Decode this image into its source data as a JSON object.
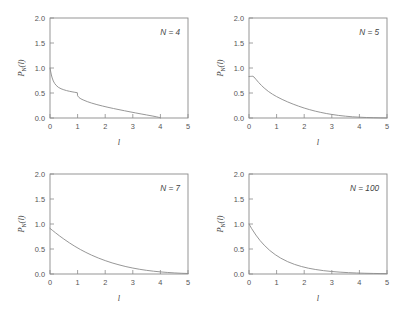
{
  "figure": {
    "background": "#ffffff",
    "curve_color": "#8b8b8b",
    "axis_color": "#8a8a8a",
    "panel_count": 4
  },
  "axes": {
    "xlabel": "l",
    "ylabel_main": "P",
    "ylabel_sub": "N",
    "ylabel_arg": "(l)",
    "xticks": [
      "0",
      "1",
      "2",
      "3",
      "4",
      "5"
    ],
    "yticks": [
      "0.0",
      "0.5",
      "1.0",
      "1.5",
      "2.0"
    ],
    "xlim": [
      0,
      5
    ],
    "ylim": [
      0,
      2
    ]
  },
  "panels": [
    {
      "id": "panel-n4",
      "annotation": "N = 4"
    },
    {
      "id": "panel-n5",
      "annotation": "N = 5"
    },
    {
      "id": "panel-n7",
      "annotation": "N = 7"
    },
    {
      "id": "panel-n100",
      "annotation": "N = 100"
    }
  ],
  "chart_data": {
    "type": "line",
    "title": "",
    "xlabel": "l",
    "ylabel": "P_N(l)",
    "xlim": [
      0,
      5
    ],
    "ylim": [
      0,
      2
    ],
    "xticks": [
      0,
      1,
      2,
      3,
      4,
      5
    ],
    "yticks": [
      0.0,
      0.5,
      1.0,
      1.5,
      2.0
    ],
    "grid": false,
    "legend": "none",
    "panel_layout": "2x2",
    "series": [
      {
        "name": "N = 4",
        "annotation": "N = 4",
        "panel": 0,
        "x": [
          0.0,
          0.02,
          0.05,
          0.08,
          0.12,
          0.17,
          0.22,
          0.3,
          0.4,
          0.5,
          0.6,
          0.7,
          0.8,
          0.9,
          0.99,
          1.0,
          1.05,
          1.12,
          1.2,
          1.35,
          1.5,
          1.7,
          1.9,
          2.1,
          2.3,
          2.5,
          2.7,
          2.9,
          3.1,
          3.3,
          3.5,
          3.7,
          3.85,
          3.94,
          3.98,
          4.0
        ],
        "y": [
          1.0,
          0.94,
          0.86,
          0.8,
          0.74,
          0.69,
          0.655,
          0.615,
          0.585,
          0.565,
          0.548,
          0.535,
          0.524,
          0.514,
          0.506,
          0.445,
          0.41,
          0.383,
          0.362,
          0.328,
          0.3,
          0.268,
          0.24,
          0.214,
          0.19,
          0.167,
          0.145,
          0.123,
          0.102,
          0.081,
          0.061,
          0.041,
          0.025,
          0.013,
          0.006,
          0.0
        ]
      },
      {
        "name": "N = 5",
        "annotation": "N = 5",
        "panel": 1,
        "x": [
          0.0,
          0.05,
          0.1,
          0.14,
          0.18,
          0.25,
          0.35,
          0.45,
          0.55,
          0.7,
          0.85,
          1.0,
          1.2,
          1.4,
          1.6,
          1.8,
          2.0,
          2.2,
          2.4,
          2.6,
          2.8,
          3.0,
          3.25,
          3.5,
          3.75,
          4.0,
          4.25,
          4.5,
          4.75,
          5.0
        ],
        "y": [
          0.83,
          0.832,
          0.834,
          0.835,
          0.82,
          0.775,
          0.71,
          0.652,
          0.6,
          0.532,
          0.476,
          0.428,
          0.372,
          0.322,
          0.277,
          0.236,
          0.199,
          0.166,
          0.137,
          0.112,
          0.09,
          0.071,
          0.051,
          0.036,
          0.024,
          0.016,
          0.01,
          0.006,
          0.003,
          0.001
        ]
      },
      {
        "name": "N = 7",
        "annotation": "N = 7",
        "panel": 2,
        "x": [
          0.0,
          0.1,
          0.2,
          0.35,
          0.5,
          0.7,
          0.9,
          1.1,
          1.3,
          1.5,
          1.75,
          2.0,
          2.25,
          2.5,
          2.75,
          3.0,
          3.25,
          3.5,
          3.75,
          4.0,
          4.25,
          4.5,
          4.75,
          5.0
        ],
        "y": [
          0.912,
          0.868,
          0.824,
          0.76,
          0.7,
          0.624,
          0.554,
          0.49,
          0.432,
          0.379,
          0.32,
          0.268,
          0.222,
          0.183,
          0.148,
          0.119,
          0.094,
          0.073,
          0.056,
          0.042,
          0.031,
          0.022,
          0.015,
          0.01
        ]
      },
      {
        "name": "N = 100",
        "annotation": "N = 100",
        "panel": 3,
        "x": [
          0.0,
          0.1,
          0.25,
          0.4,
          0.55,
          0.75,
          0.95,
          1.15,
          1.4,
          1.65,
          1.9,
          2.15,
          2.4,
          2.7,
          3.0,
          3.3,
          3.6,
          3.9,
          4.2,
          4.5,
          4.75,
          5.0
        ],
        "y": [
          1.0,
          0.905,
          0.779,
          0.67,
          0.577,
          0.472,
          0.387,
          0.317,
          0.247,
          0.192,
          0.15,
          0.116,
          0.091,
          0.067,
          0.05,
          0.037,
          0.027,
          0.02,
          0.015,
          0.011,
          0.009,
          0.007
        ]
      }
    ]
  }
}
